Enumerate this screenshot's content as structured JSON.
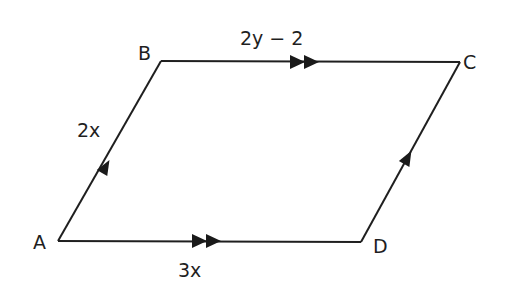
{
  "diagram": {
    "type": "parallelogram",
    "vertices": [
      {
        "name": "A",
        "x": 58,
        "y": 241
      },
      {
        "name": "B",
        "x": 161,
        "y": 61
      },
      {
        "name": "C",
        "x": 460,
        "y": 62
      },
      {
        "name": "D",
        "x": 361,
        "y": 242
      }
    ],
    "labels": {
      "A": "A",
      "B": "B",
      "C": "C",
      "D": "D"
    },
    "edges": {
      "AB": {
        "label": "2x",
        "arrows": 1
      },
      "BC": {
        "label": "2y − 2",
        "arrows": 2
      },
      "AD": {
        "label": "3x",
        "arrows": 2
      },
      "DC": {
        "label": "",
        "arrows": 1
      }
    },
    "colors": {
      "stroke": "#1f1f1f",
      "background": "#ffffff"
    }
  }
}
